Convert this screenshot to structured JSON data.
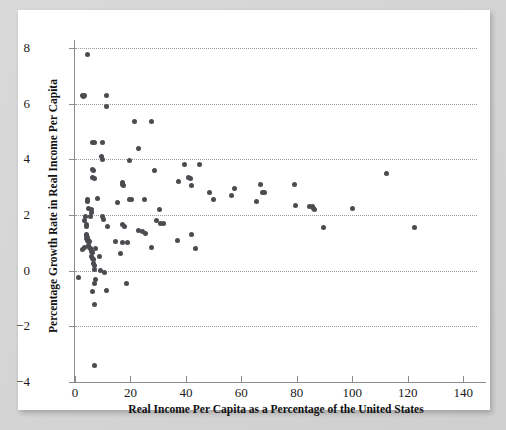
{
  "figure": {
    "background_color": "#d2d2d2",
    "card_color": "#ffffff",
    "point_color": "#4b4b50",
    "gridline_color": "#9a9a9a",
    "axis_color": "#8b8b8b"
  },
  "chart_data": {
    "type": "scatter",
    "title": "",
    "xlabel": "Real Income Per Capita as a Percentage of the United States",
    "ylabel": "Percentage Growth Rate in Real Income Per Capita",
    "xlim": [
      0,
      145
    ],
    "ylim": [
      -4,
      8
    ],
    "xticks": [
      0,
      20,
      40,
      60,
      80,
      100,
      120,
      140
    ],
    "xtick_labels": [
      "0",
      "20",
      "40",
      "60",
      "80",
      "100",
      "120",
      "140"
    ],
    "yticks": [
      -4,
      -2,
      0,
      2,
      4,
      6,
      8
    ],
    "ytick_labels": [
      "−4",
      "−2",
      "0",
      "2",
      "4",
      "6",
      "8"
    ],
    "grid": true,
    "grid_axis": "y",
    "grid_style": "dotted",
    "grid_values": [
      -2,
      0,
      2,
      4,
      6,
      8
    ],
    "legend": null,
    "marker": "circle",
    "marker_size": 5,
    "points": [
      [
        4.6,
        7.75
      ],
      [
        2.6,
        6.3
      ],
      [
        3.1,
        6.25
      ],
      [
        3.4,
        6.3
      ],
      [
        11.2,
        6.3
      ],
      [
        11.4,
        5.9
      ],
      [
        21.5,
        5.35
      ],
      [
        27.5,
        5.35
      ],
      [
        6.3,
        4.6
      ],
      [
        6.9,
        4.6
      ],
      [
        9.8,
        4.6
      ],
      [
        23.0,
        4.4
      ],
      [
        9.6,
        4.1
      ],
      [
        9.9,
        4.0
      ],
      [
        19.5,
        3.95
      ],
      [
        39.5,
        3.8
      ],
      [
        45.0,
        3.8
      ],
      [
        6.4,
        3.65
      ],
      [
        6.6,
        3.6
      ],
      [
        28.5,
        3.6
      ],
      [
        112.5,
        3.5
      ],
      [
        6.2,
        3.35
      ],
      [
        7.2,
        3.3
      ],
      [
        41.0,
        3.35
      ],
      [
        41.5,
        3.3
      ],
      [
        17.0,
        3.15
      ],
      [
        17.3,
        3.1
      ],
      [
        17.6,
        3.05
      ],
      [
        37.5,
        3.2
      ],
      [
        42.0,
        3.05
      ],
      [
        67.0,
        3.1
      ],
      [
        79.0,
        3.1
      ],
      [
        57.5,
        2.95
      ],
      [
        4.4,
        2.55
      ],
      [
        8.1,
        2.6
      ],
      [
        4.6,
        2.5
      ],
      [
        48.5,
        2.8
      ],
      [
        67.5,
        2.8
      ],
      [
        68.5,
        2.8
      ],
      [
        15.5,
        2.45
      ],
      [
        19.5,
        2.55
      ],
      [
        20.5,
        2.55
      ],
      [
        25.0,
        2.55
      ],
      [
        56.5,
        2.7
      ],
      [
        50.0,
        2.55
      ],
      [
        65.5,
        2.5
      ],
      [
        5.0,
        2.25
      ],
      [
        5.8,
        2.2
      ],
      [
        6.0,
        2.1
      ],
      [
        79.5,
        2.35
      ],
      [
        84.5,
        2.3
      ],
      [
        85.5,
        2.3
      ],
      [
        86.0,
        2.25
      ],
      [
        100.0,
        2.25
      ],
      [
        86.5,
        2.2
      ],
      [
        30.5,
        2.2
      ],
      [
        3.9,
        1.95
      ],
      [
        5.6,
        1.95
      ],
      [
        9.9,
        1.95
      ],
      [
        10.4,
        1.85
      ],
      [
        3.3,
        1.8
      ],
      [
        29.5,
        1.8
      ],
      [
        4.0,
        1.65
      ],
      [
        4.2,
        1.6
      ],
      [
        11.8,
        1.6
      ],
      [
        17.2,
        1.65
      ],
      [
        18.0,
        1.6
      ],
      [
        31.0,
        1.7
      ],
      [
        32.0,
        1.7
      ],
      [
        89.5,
        1.55
      ],
      [
        122.5,
        1.55
      ],
      [
        23.0,
        1.45
      ],
      [
        24.5,
        1.4
      ],
      [
        25.5,
        1.35
      ],
      [
        4.1,
        1.3
      ],
      [
        4.3,
        1.25
      ],
      [
        4.6,
        1.2
      ],
      [
        42.0,
        1.3
      ],
      [
        4.2,
        1.15
      ],
      [
        4.4,
        1.1
      ],
      [
        4.8,
        1.1
      ],
      [
        5.0,
        1.05
      ],
      [
        5.2,
        1.05
      ],
      [
        14.5,
        1.05
      ],
      [
        17.0,
        1.0
      ],
      [
        19.0,
        1.0
      ],
      [
        37.0,
        1.1
      ],
      [
        3.3,
        0.85
      ],
      [
        4.9,
        0.9
      ],
      [
        5.3,
        0.85
      ],
      [
        5.6,
        0.8
      ],
      [
        27.5,
        0.85
      ],
      [
        43.5,
        0.8
      ],
      [
        2.7,
        0.75
      ],
      [
        5.8,
        0.7
      ],
      [
        6.2,
        0.65
      ],
      [
        7.4,
        0.8
      ],
      [
        6.0,
        0.5
      ],
      [
        6.4,
        0.45
      ],
      [
        16.5,
        0.6
      ],
      [
        6.8,
        0.4
      ],
      [
        9.0,
        0.5
      ],
      [
        6.6,
        0.25
      ],
      [
        6.9,
        0.2
      ],
      [
        7.1,
        0.05
      ],
      [
        9.3,
        0.0
      ],
      [
        10.8,
        -0.05
      ],
      [
        1.4,
        -0.25
      ],
      [
        7.3,
        -0.3
      ],
      [
        7.0,
        -0.45
      ],
      [
        18.5,
        -0.45
      ],
      [
        6.4,
        -0.75
      ],
      [
        11.5,
        -0.7
      ],
      [
        7.2,
        -1.2
      ],
      [
        6.9,
        -3.4
      ]
    ]
  }
}
